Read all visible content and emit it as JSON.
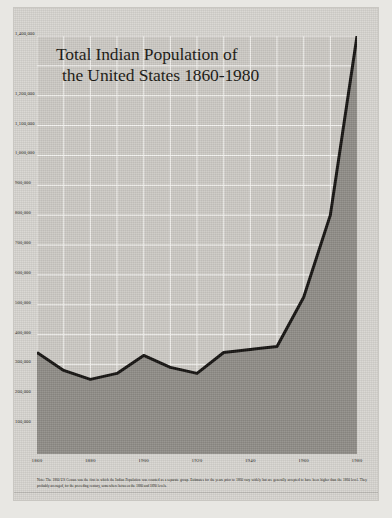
{
  "poster": {
    "title_line1": "Total Indian Population of",
    "title_line2": "the United States 1860-1980",
    "note": "Note: The 1860 US Census was the first in which the Indian Population was counted as a separate group. Estimates for the years prior to 1860 vary widely but are generally accepted to have been higher than the 1860 level. They probably averaged, for the preceding century, somewhere between the 1880 and 1890 levels."
  },
  "chart_data": {
    "type": "area",
    "title": "Total Indian Population of the United States 1860-1980",
    "xlabel": "",
    "ylabel": "",
    "xlim": [
      1860,
      1980
    ],
    "ylim": [
      0,
      1400000
    ],
    "grid": true,
    "legend": "none",
    "x_ticks": [
      1860,
      1880,
      1900,
      1920,
      1940,
      1960,
      1980
    ],
    "x_tick_labels": [
      "1860",
      "1880",
      "1900",
      "1920",
      "1940",
      "1960",
      "1980"
    ],
    "x_gridlines": [
      1860,
      1870,
      1880,
      1890,
      1900,
      1910,
      1920,
      1930,
      1940,
      1950,
      1960,
      1970,
      1980
    ],
    "y_ticks": [
      100000,
      200000,
      300000,
      400000,
      500000,
      600000,
      700000,
      800000,
      900000,
      1000000,
      1100000,
      1200000,
      1300000,
      1400000
    ],
    "y_tick_labels": [
      "100,000",
      "200,000",
      "300,000",
      "400,000",
      "500,000",
      "600,000",
      "700,000",
      "800,000",
      "900,000",
      "1,000,000",
      "1,100,000",
      "1,200,000",
      "1,300,000",
      "1,400,000"
    ],
    "y_tick_labels_visible": [
      "100,000",
      "200,000",
      "300,000",
      "400,000",
      "500,000",
      "600,000",
      "700,000",
      "800,000",
      "900,000",
      "1,000,000",
      "1,100,000",
      "1,200,000",
      "1,400,000"
    ],
    "x": [
      1860,
      1870,
      1880,
      1890,
      1900,
      1910,
      1920,
      1930,
      1940,
      1950,
      1960,
      1970,
      1980
    ],
    "values": [
      340000,
      280000,
      250000,
      270000,
      330000,
      290000,
      270000,
      340000,
      350000,
      360000,
      525000,
      800000,
      1400000
    ],
    "series": [
      {
        "name": "Total Indian Population",
        "values": [
          340000,
          280000,
          250000,
          270000,
          330000,
          290000,
          270000,
          340000,
          350000,
          360000,
          525000,
          800000,
          1400000
        ]
      }
    ],
    "line_color": "#141210",
    "fill_color": "#8f8c87"
  }
}
